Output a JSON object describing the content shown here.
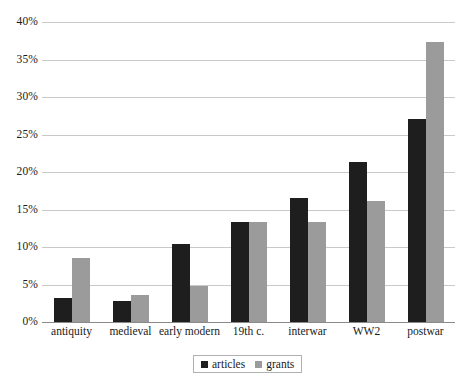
{
  "chart_data": {
    "type": "bar",
    "title": "",
    "subtitle": "",
    "xlabel": "",
    "ylabel": "",
    "categories": [
      "antiquity",
      "medieval",
      "early modern",
      "19th c.",
      "interwar",
      "WW2",
      "postwar"
    ],
    "series": [
      {
        "name": "articles",
        "color": "#1e1e1e",
        "values": [
          3.2,
          2.8,
          10.4,
          13.4,
          16.6,
          21.4,
          27.1
        ]
      },
      {
        "name": "grants",
        "color": "#9b9b9b",
        "values": [
          8.6,
          3.6,
          4.8,
          13.4,
          13.4,
          16.1,
          37.4
        ]
      }
    ],
    "ylim": [
      0,
      40
    ],
    "ytick_values": [
      0,
      5,
      10,
      15,
      20,
      25,
      30,
      35,
      40
    ],
    "ytick_labels": [
      "0%",
      "5%",
      "10%",
      "15%",
      "20%",
      "25%",
      "30%",
      "35%",
      "40%"
    ],
    "grid": true,
    "grid_axis": "y",
    "grid_color": "#c9c9c9",
    "legend_position": "bottom-center",
    "background": "#ffffff"
  },
  "legend": {
    "entries": [
      {
        "label": "articles",
        "color": "#1e1e1e"
      },
      {
        "label": "grants",
        "color": "#9b9b9b"
      }
    ]
  }
}
